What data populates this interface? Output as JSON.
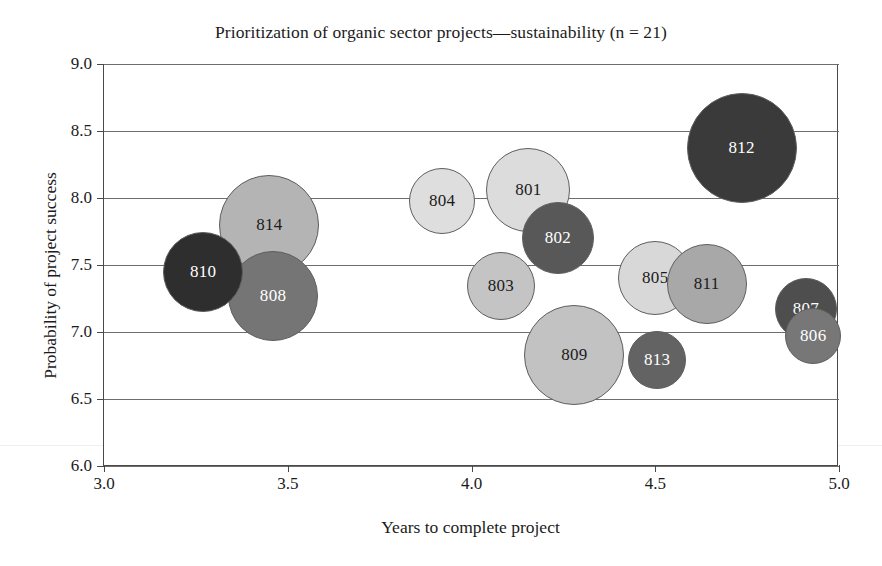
{
  "chart_data": {
    "type": "scatter",
    "variant": "bubble",
    "title": "Prioritization of organic sector projects—sustainability (n = 21)",
    "xlabel": "Years to complete project",
    "ylabel": "Probability of project success",
    "xlim": [
      3.0,
      5.0
    ],
    "ylim": [
      6.0,
      9.0
    ],
    "xticks": [
      "3.0",
      "3.5",
      "4.0",
      "4.5",
      "5.0"
    ],
    "xtick_values": [
      3.0,
      3.5,
      4.0,
      4.5,
      5.0
    ],
    "yticks": [
      "9.0",
      "8.5",
      "8.0",
      "7.5",
      "7.0",
      "6.5",
      "6.0"
    ],
    "ytick_values": [
      9.0,
      8.5,
      8.0,
      7.5,
      7.0,
      6.5,
      6.0
    ],
    "grid": "horizontal",
    "legend": "none",
    "points": [
      {
        "label": "801",
        "x": 4.155,
        "y": 8.06,
        "r_px": 42,
        "fill": "#dcdcdc",
        "text_color": "#1b1b1b",
        "z": 3
      },
      {
        "label": "802",
        "x": 4.235,
        "y": 7.7,
        "r_px": 36,
        "fill": "#585858",
        "text_color": "#ffffff",
        "z": 6
      },
      {
        "label": "803",
        "x": 4.08,
        "y": 7.34,
        "r_px": 34,
        "fill": "#c4c4c4",
        "text_color": "#1b1b1b",
        "z": 3
      },
      {
        "label": "804",
        "x": 3.92,
        "y": 7.98,
        "r_px": 33,
        "fill": "#dedede",
        "text_color": "#1b1b1b",
        "z": 3
      },
      {
        "label": "805",
        "x": 4.5,
        "y": 7.4,
        "r_px": 37,
        "fill": "#d8d8d8",
        "text_color": "#1b1b1b",
        "z": 2
      },
      {
        "label": "806",
        "x": 4.93,
        "y": 6.97,
        "r_px": 28,
        "fill": "#777777",
        "text_color": "#ffffff",
        "z": 6
      },
      {
        "label": "807",
        "x": 4.91,
        "y": 7.17,
        "r_px": 31,
        "fill": "#4e4e4e",
        "text_color": "#ffffff",
        "z": 4
      },
      {
        "label": "808",
        "x": 3.46,
        "y": 7.27,
        "r_px": 45,
        "fill": "#757575",
        "text_color": "#ffffff",
        "z": 5
      },
      {
        "label": "809",
        "x": 4.28,
        "y": 6.83,
        "r_px": 50,
        "fill": "#c2c2c2",
        "text_color": "#1b1b1b",
        "z": 3
      },
      {
        "label": "810",
        "x": 3.27,
        "y": 7.45,
        "r_px": 40,
        "fill": "#2e2e2e",
        "text_color": "#ffffff",
        "z": 6
      },
      {
        "label": "811",
        "x": 4.64,
        "y": 7.36,
        "r_px": 40,
        "fill": "#a8a8a8",
        "text_color": "#1b1b1b",
        "z": 4
      },
      {
        "label": "812",
        "x": 4.735,
        "y": 8.37,
        "r_px": 55,
        "fill": "#3a3a3a",
        "text_color": "#ffffff",
        "z": 3
      },
      {
        "label": "813",
        "x": 4.505,
        "y": 6.79,
        "r_px": 29,
        "fill": "#636363",
        "text_color": "#ffffff",
        "z": 6
      },
      {
        "label": "814",
        "x": 3.45,
        "y": 7.8,
        "r_px": 50,
        "fill": "#b4b4b4",
        "text_color": "#1b1b1b",
        "z": 2
      }
    ]
  },
  "colors": {
    "frame": "#4a4a4a",
    "gridline": "#6d6d6d",
    "text": "#1b1b1b",
    "background": "#ffffff"
  }
}
